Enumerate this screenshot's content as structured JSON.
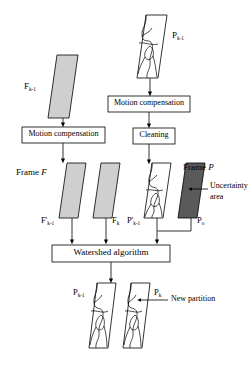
{
  "figure": {
    "type": "flow-diagram"
  },
  "inputs": {
    "frame_prev": {
      "label_main": "F",
      "label_sub": "k-1",
      "fill": "#cfcfcf"
    },
    "partition_prev": {
      "label_main": "P",
      "label_sub": "k-1",
      "fill": "#ffffff"
    }
  },
  "process_boxes": [
    {
      "id": "motion-compensation-left",
      "label": "Motion compensation"
    },
    {
      "id": "motion-compensation-right",
      "label": "Motion compensation"
    },
    {
      "id": "cleaning",
      "label": "Cleaning"
    },
    {
      "id": "watershed",
      "label": "Watershed algorithm"
    }
  ],
  "frame_f": {
    "group_label": "Frame F",
    "group_label_plain": "Frame",
    "group_label_italic": "F",
    "planes": [
      {
        "label_main": "F",
        "label_prime": "'",
        "label_sub": "k-1",
        "fill": "#cfcfcf"
      },
      {
        "label_main": "F",
        "label_prime": "",
        "label_sub": "k",
        "fill": "#cfcfcf"
      }
    ]
  },
  "frame_p": {
    "group_label": "Frame P",
    "group_label_plain": "Frame",
    "group_label_italic": "P",
    "planes": [
      {
        "label_main": "P",
        "label_prime": "'",
        "label_sub": "k-1",
        "fill": "#ffffff"
      },
      {
        "label_main": "P",
        "label_prime": "",
        "label_sub": "o",
        "fill": "#5a5a5a"
      }
    ],
    "annotation": {
      "line1": "Uncertainty",
      "line2": "area"
    }
  },
  "outputs": {
    "planes": [
      {
        "label_main": "P",
        "label_sub": "k-1",
        "fill": "#ffffff"
      },
      {
        "label_main": "P",
        "label_sub": "k",
        "fill": "#ffffff"
      }
    ],
    "annotation": "New partition"
  },
  "colors": {
    "stroke": "#000000",
    "gray_light": "#cfcfcf",
    "gray_dark": "#5a5a5a",
    "white": "#ffffff"
  }
}
